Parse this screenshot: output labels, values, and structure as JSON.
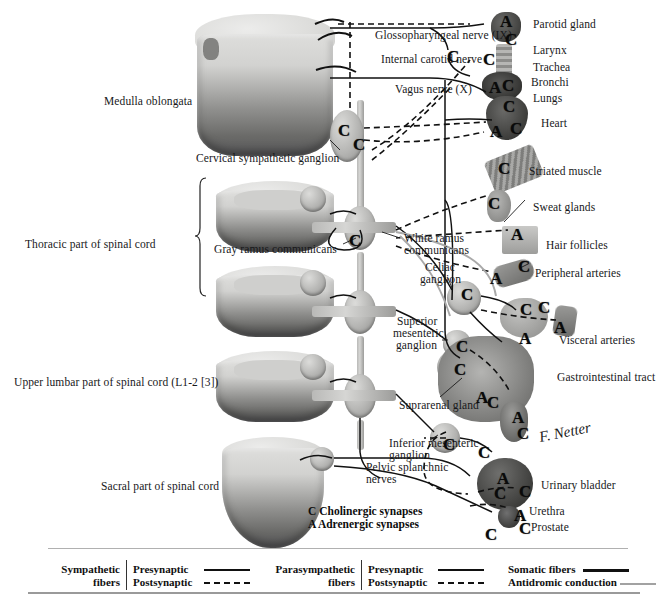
{
  "figure": {
    "background_color": "#ffffff",
    "signature": "F. Netter"
  },
  "key": {
    "cholinergic": "C Cholinergic synapses",
    "adrenergic": "A Adrenergic synapses",
    "c_symbol": "C",
    "a_symbol": "A"
  },
  "left_labels": [
    {
      "text": "Medulla oblongata",
      "x": 104,
      "y": 95
    },
    {
      "text": "Thoracic part of spinal cord",
      "x": 25,
      "y": 238
    },
    {
      "text": "Upper lumbar part of spinal cord (L1-2 [3])",
      "x": 14,
      "y": 376
    },
    {
      "text": "Sacral part of spinal cord",
      "x": 101,
      "y": 480
    }
  ],
  "center_labels": [
    {
      "text": "Glossopharyngeal nerve (IX)",
      "x": 375,
      "y": 29
    },
    {
      "text": "Internal carotid nerve",
      "x": 381,
      "y": 53
    },
    {
      "text": "Vagus nerve (X)",
      "x": 395,
      "y": 83
    },
    {
      "text": "Cervical sympathetic ganglion",
      "x": 196,
      "y": 152
    },
    {
      "text": "Gray ramus communicans",
      "x": 214,
      "y": 243
    },
    {
      "text": "White ramus",
      "x": 404,
      "y": 232
    },
    {
      "text": "communicans",
      "x": 404,
      "y": 244
    },
    {
      "text": "Celiac",
      "x": 425,
      "y": 261
    },
    {
      "text": "ganglion",
      "x": 420,
      "y": 273
    },
    {
      "text": "Superior",
      "x": 397,
      "y": 315
    },
    {
      "text": "mesenteric",
      "x": 393,
      "y": 327
    },
    {
      "text": "ganglion",
      "x": 396,
      "y": 339
    },
    {
      "text": "Suprarenal gland",
      "x": 399,
      "y": 399
    },
    {
      "text": "Inferior mesenteric",
      "x": 389,
      "y": 437
    },
    {
      "text": "ganglion",
      "x": 389,
      "y": 449
    },
    {
      "text": "Pelvic splanchnic",
      "x": 366,
      "y": 461
    },
    {
      "text": "nerves",
      "x": 366,
      "y": 473
    }
  ],
  "right_labels": [
    {
      "text": "Parotid gland",
      "x": 533,
      "y": 18
    },
    {
      "text": "Larynx",
      "x": 533,
      "y": 44
    },
    {
      "text": "Trachea",
      "x": 533,
      "y": 61
    },
    {
      "text": "Bronchi",
      "x": 531,
      "y": 76
    },
    {
      "text": "Lungs",
      "x": 533,
      "y": 92
    },
    {
      "text": "Heart",
      "x": 541,
      "y": 117
    },
    {
      "text": "Striated muscle",
      "x": 529,
      "y": 165
    },
    {
      "text": "Sweat glands",
      "x": 533,
      "y": 201
    },
    {
      "text": "Hair follicles",
      "x": 546,
      "y": 239
    },
    {
      "text": "Peripheral arteries",
      "x": 535,
      "y": 267
    },
    {
      "text": "Visceral arteries",
      "x": 559,
      "y": 334
    },
    {
      "text": "Gastrointestinal tract",
      "x": 557,
      "y": 371
    },
    {
      "text": "Urinary bladder",
      "x": 541,
      "y": 479
    },
    {
      "text": "Urethra",
      "x": 529,
      "y": 505
    },
    {
      "text": "Prostate",
      "x": 531,
      "y": 521
    }
  ],
  "synapse_markers": [
    {
      "symbol": "A",
      "x": 500,
      "y": 14,
      "size": "big"
    },
    {
      "symbol": "C",
      "x": 505,
      "y": 32,
      "size": "big"
    },
    {
      "symbol": "C",
      "x": 447,
      "y": 49,
      "size": "big"
    },
    {
      "symbol": "C",
      "x": 483,
      "y": 52,
      "size": "big"
    },
    {
      "symbol": "A",
      "x": 489,
      "y": 80,
      "size": "big"
    },
    {
      "symbol": "C",
      "x": 502,
      "y": 78,
      "size": "big"
    },
    {
      "symbol": "C",
      "x": 503,
      "y": 99,
      "size": "big"
    },
    {
      "symbol": "A",
      "x": 490,
      "y": 124,
      "size": "big"
    },
    {
      "symbol": "C",
      "x": 510,
      "y": 121,
      "size": "big"
    },
    {
      "symbol": "C",
      "x": 338,
      "y": 123,
      "size": "big"
    },
    {
      "symbol": "C",
      "x": 353,
      "y": 137,
      "size": "big"
    },
    {
      "symbol": "C",
      "x": 349,
      "y": 233,
      "size": "big"
    },
    {
      "symbol": "C",
      "x": 498,
      "y": 161,
      "size": "big"
    },
    {
      "symbol": "C",
      "x": 488,
      "y": 196,
      "size": "big"
    },
    {
      "symbol": "A",
      "x": 511,
      "y": 227,
      "size": "big"
    },
    {
      "symbol": "C",
      "x": 518,
      "y": 259,
      "size": "big"
    },
    {
      "symbol": "A",
      "x": 490,
      "y": 271,
      "size": "big"
    },
    {
      "symbol": "C",
      "x": 461,
      "y": 287,
      "size": "big"
    },
    {
      "symbol": "C",
      "x": 520,
      "y": 302,
      "size": "big"
    },
    {
      "symbol": "C",
      "x": 538,
      "y": 300,
      "size": "big"
    },
    {
      "symbol": "A",
      "x": 519,
      "y": 331,
      "size": "big"
    },
    {
      "symbol": "A",
      "x": 554,
      "y": 320,
      "size": "big"
    },
    {
      "symbol": "C",
      "x": 456,
      "y": 339,
      "size": "big"
    },
    {
      "symbol": "C",
      "x": 454,
      "y": 362,
      "size": "big"
    },
    {
      "symbol": "A",
      "x": 476,
      "y": 390,
      "size": "big"
    },
    {
      "symbol": "C",
      "x": 487,
      "y": 395,
      "size": "big"
    },
    {
      "symbol": "A",
      "x": 512,
      "y": 410,
      "size": "big"
    },
    {
      "symbol": "C",
      "x": 517,
      "y": 426,
      "size": "big"
    },
    {
      "symbol": "C",
      "x": 443,
      "y": 437,
      "size": "big"
    },
    {
      "symbol": "C",
      "x": 478,
      "y": 445,
      "size": "big"
    },
    {
      "symbol": "A",
      "x": 497,
      "y": 471,
      "size": "big"
    },
    {
      "symbol": "C",
      "x": 494,
      "y": 486,
      "size": "big"
    },
    {
      "symbol": "C",
      "x": 519,
      "y": 484,
      "size": "big"
    },
    {
      "symbol": "A",
      "x": 514,
      "y": 508,
      "size": "big"
    },
    {
      "symbol": "C",
      "x": 519,
      "y": 521,
      "size": "big"
    },
    {
      "symbol": "C",
      "x": 485,
      "y": 527,
      "size": "big"
    }
  ],
  "legend": {
    "groups": [
      {
        "name": "sympathetic",
        "title_line1": "Sympathetic",
        "title_line2": "fibers",
        "rows": [
          {
            "label": "Presynaptic",
            "style": "solid"
          },
          {
            "label": "Postsynaptic",
            "style": "dashed"
          }
        ]
      },
      {
        "name": "parasympathetic",
        "title_line1": "Parasympathetic",
        "title_line2": "fibers",
        "rows": [
          {
            "label": "Presynaptic",
            "style": "solid"
          },
          {
            "label": "Postsynaptic",
            "style": "dashed"
          }
        ]
      }
    ],
    "other": [
      {
        "label": "Somatic fibers",
        "style": "solid-black"
      },
      {
        "label": "Antidromic conduction",
        "style": "solid-gray"
      }
    ]
  }
}
